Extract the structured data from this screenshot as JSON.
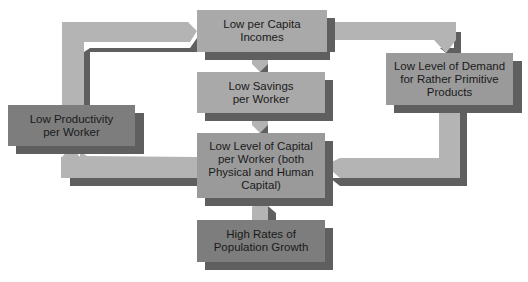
{
  "diagram": {
    "type": "cycle-flowchart",
    "colors": {
      "light_box": "#a9a9a9",
      "dark_box": "#7d7d7d",
      "arrow_light": "#b4b4b4",
      "arrow_shadow": "#5f5f5f"
    },
    "nodes": {
      "incomes": {
        "label": "Low per Capita Incomes"
      },
      "savings": {
        "label": "Low Savings per Worker"
      },
      "capital": {
        "label": "Low Level of Capital per Worker (both Physical and Human Capital)"
      },
      "population": {
        "label": "High Rates of Population Growth"
      },
      "productivity": {
        "label": "Low Productivity per Worker"
      },
      "demand": {
        "label": "Low Level of Demand for Rather Primitive Products"
      }
    },
    "edges": [
      {
        "from": "incomes",
        "to": "savings"
      },
      {
        "from": "savings",
        "to": "capital"
      },
      {
        "from": "population",
        "to": "capital"
      },
      {
        "from": "capital",
        "to": "productivity"
      },
      {
        "from": "productivity",
        "to": "incomes"
      },
      {
        "from": "incomes",
        "to": "demand"
      },
      {
        "from": "demand",
        "to": "capital"
      }
    ]
  }
}
